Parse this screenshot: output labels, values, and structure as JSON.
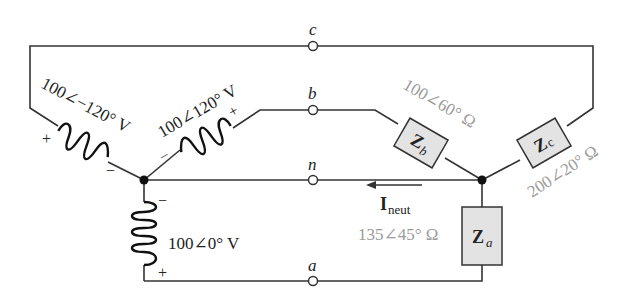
{
  "diagram": {
    "type": "three-phase Y-Y circuit with neutral",
    "terminals": {
      "a": "a",
      "b": "b",
      "c": "c",
      "n": "n"
    },
    "sources": [
      {
        "id": "Va",
        "label": "100∠0° V",
        "plus": "+",
        "minus": "−"
      },
      {
        "id": "Vb",
        "label": "100∠120° V",
        "plus": "+",
        "minus": "−"
      },
      {
        "id": "Vc",
        "label": "100∠−120° V",
        "plus": "+",
        "minus": "−"
      }
    ],
    "loads": [
      {
        "id": "Za",
        "name": "Z",
        "sub": "a",
        "value": "135∠45° Ω"
      },
      {
        "id": "Zb",
        "name": "Z",
        "sub": "b",
        "value": "100∠60° Ω"
      },
      {
        "id": "Zc",
        "name": "Z",
        "sub": "c",
        "value": "200∠20° Ω"
      }
    ],
    "current": {
      "name": "I",
      "sub": "neut"
    }
  }
}
